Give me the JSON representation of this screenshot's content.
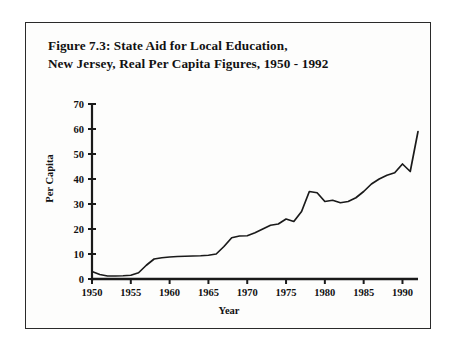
{
  "figure": {
    "title_line1": "Figure 7.3: State Aid for Local Education,",
    "title_line2": "New Jersey, Real Per Capita Figures, 1950 - 1992"
  },
  "chart_data": {
    "type": "line",
    "title": "Figure 7.3: State Aid for Local Education, New Jersey, Real Per Capita Figures, 1950 - 1992",
    "xlabel": "Year",
    "ylabel": "Per Capita",
    "xlim": [
      1950,
      1992
    ],
    "ylim": [
      0,
      70
    ],
    "xticks": [
      1950,
      1955,
      1960,
      1965,
      1970,
      1975,
      1980,
      1985,
      1990
    ],
    "yticks": [
      0,
      10,
      20,
      30,
      40,
      50,
      60,
      70
    ],
    "grid": false,
    "legend": null,
    "line_color": "#1a1a1a",
    "x": [
      1950,
      1951,
      1952,
      1953,
      1954,
      1955,
      1956,
      1957,
      1958,
      1959,
      1960,
      1961,
      1962,
      1963,
      1964,
      1965,
      1966,
      1967,
      1968,
      1969,
      1970,
      1971,
      1972,
      1973,
      1974,
      1975,
      1976,
      1977,
      1978,
      1979,
      1980,
      1981,
      1982,
      1983,
      1984,
      1985,
      1986,
      1987,
      1988,
      1989,
      1990,
      1991,
      1992
    ],
    "values": [
      3.0,
      1.8,
      1.2,
      1.2,
      1.3,
      1.5,
      2.5,
      5.5,
      8.0,
      8.5,
      8.8,
      9.0,
      9.1,
      9.2,
      9.3,
      9.5,
      10.0,
      13.0,
      16.5,
      17.2,
      17.3,
      18.5,
      20.0,
      21.5,
      22.0,
      24.0,
      23.0,
      27.0,
      35.0,
      34.5,
      31.0,
      31.5,
      30.5,
      31.0,
      32.5,
      35.0,
      38.0,
      40.0,
      41.5,
      42.5,
      46.0,
      43.0,
      59.0
    ]
  }
}
